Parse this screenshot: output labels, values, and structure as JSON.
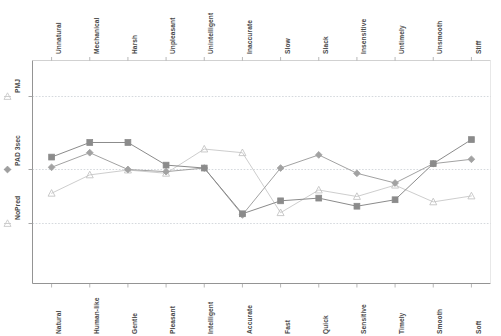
{
  "chart_data": {
    "type": "line",
    "title": "",
    "subtitle": "",
    "xlabel": "",
    "ylabel": "",
    "grid": true,
    "legend_position": "y-axis-left",
    "axis_style": "bipolar semantic differential",
    "categories_bottom": [
      "Natural",
      "Human-like",
      "Gentle",
      "Pleasant",
      "Intelligent",
      "Accurate",
      "Fast",
      "Quick",
      "Sensitive",
      "Timely",
      "Smooth",
      "Soft"
    ],
    "categories_top": [
      "Unnatural",
      "Mechanical",
      "Harsh",
      "Unpleasant",
      "Unintelligent",
      "Inaccurate",
      "Slow",
      "Slack",
      "Insensitive",
      "Untimely",
      "Unsmooth",
      "Stiff"
    ],
    "x": [
      "Natural",
      "Human-like",
      "Gentle",
      "Pleasant",
      "Intelligent",
      "Accurate",
      "Fast",
      "Quick",
      "Sensitive",
      "Timely",
      "Smooth",
      "Soft"
    ],
    "ytick_labels": [
      "PMJ",
      "PAD 3sec",
      "NoPred"
    ],
    "ytick_values": [
      3,
      2,
      1
    ],
    "ylim": [
      0.4,
      3.6
    ],
    "series": [
      {
        "name": "PMJ",
        "marker": "square",
        "color": "#8b8b8b",
        "values": [
          2.17,
          2.37,
          2.37,
          2.06,
          2.02,
          1.18,
          1.42,
          1.47,
          1.32,
          1.44,
          2.08,
          2.41
        ]
      },
      {
        "name": "PAD 3sec",
        "marker": "diamond",
        "color": "#a2a2a2",
        "values": [
          2.03,
          2.23,
          2.0,
          1.96,
          2.02,
          1.16,
          2.02,
          2.2,
          1.93,
          1.75,
          2.08,
          2.14
        ]
      },
      {
        "name": "NoPred",
        "marker": "triangle",
        "color": "#c4c4c4",
        "values": [
          1.56,
          1.9,
          1.99,
          1.93,
          2.28,
          2.23,
          1.2,
          1.62,
          1.5,
          1.71,
          1.4,
          1.51
        ]
      }
    ]
  },
  "axis": {
    "y_labels": [
      {
        "id": "pmj",
        "text": "PMJ"
      },
      {
        "id": "pad3sec",
        "text": "PAD 3sec"
      },
      {
        "id": "nopred",
        "text": "NoPred"
      }
    ]
  }
}
